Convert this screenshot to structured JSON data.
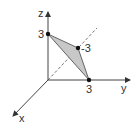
{
  "diagram": {
    "type": "3d-coordinate-axes",
    "axes": {
      "x": {
        "label": "x"
      },
      "y": {
        "label": "y"
      },
      "z": {
        "label": "z"
      }
    },
    "points": [
      {
        "id": "z-intercept",
        "label": "3",
        "coords": [
          0,
          0,
          3
        ]
      },
      {
        "id": "y-intercept",
        "label": "3",
        "coords": [
          0,
          3,
          0
        ]
      },
      {
        "id": "x-intercept",
        "label": "-3",
        "coords": [
          -3,
          0,
          0
        ]
      }
    ],
    "shaded_triangle": "Triangle connecting the three intercept points",
    "colors": {
      "axis": "#444444",
      "fill": "#c8c8c8",
      "point": "#111111",
      "dashed": "#555555"
    }
  }
}
